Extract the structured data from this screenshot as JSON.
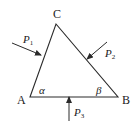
{
  "diagram": {
    "colors": {
      "stroke": "#2a2a2a",
      "text": "#1a1a1a",
      "background": "#ffffff"
    },
    "vertices": {
      "A": {
        "label": "A"
      },
      "B": {
        "label": "B"
      },
      "C": {
        "label": "C"
      }
    },
    "angles": {
      "alpha": {
        "label": "α",
        "at": "A"
      },
      "beta": {
        "label": "β",
        "at": "B"
      }
    },
    "forces": [
      {
        "name": "P",
        "sub": "1",
        "acts_on": "side AC"
      },
      {
        "name": "P",
        "sub": "2",
        "acts_on": "side BC"
      },
      {
        "name": "P",
        "sub": "3",
        "acts_on": "side AB"
      }
    ]
  }
}
